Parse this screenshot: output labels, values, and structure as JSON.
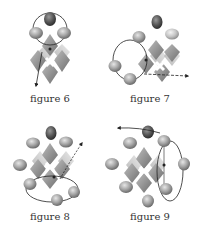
{
  "figures": [
    {
      "id": "figure-6",
      "caption": "figure 6",
      "arrow_direction": "down",
      "path": "loop around top atoms, exiting downward"
    },
    {
      "id": "figure-7",
      "caption": "figure 7",
      "arrow_direction": "right",
      "path": "loop around left atoms, exiting rightward"
    },
    {
      "id": "figure-8",
      "caption": "figure 8",
      "arrow_direction": "up-right",
      "path": "loop around bottom atoms, exiting upper-right"
    },
    {
      "id": "figure-9",
      "caption": "figure 9",
      "arrow_direction": "left",
      "path": "loop around right atoms, exiting upper-left"
    }
  ],
  "colors": {
    "background": "#ffffff",
    "caption_text": "#333333",
    "atom_dark": "#4a4a4a",
    "atom_mid": "#8a8a8a",
    "atom_light": "#c8c8c8",
    "octahedron_dark": "#7a7a7a",
    "octahedron_light": "#d0d0d0",
    "arrow": "#222222"
  }
}
